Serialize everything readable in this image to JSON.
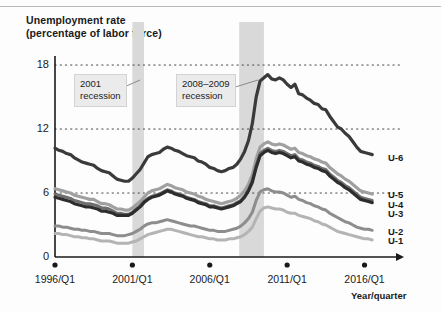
{
  "chart_data": {
    "type": "line",
    "title": "Unemployment rate",
    "subtitle": "(percentage of labor force)",
    "xlabel": "Year/quarter",
    "ylabel": "",
    "ylim": [
      0,
      19.5
    ],
    "xlim": [
      1996.0,
      2017.0
    ],
    "grid": true,
    "gridlines": [
      6,
      12,
      18
    ],
    "legend_position": "right-inline",
    "ytick_labels": [
      "0",
      "6",
      "12",
      "18"
    ],
    "ytick_values": [
      0,
      6,
      12,
      18
    ],
    "xtick_labels": [
      "1996/Q1",
      "2001/Q1",
      "2006/Q1",
      "2011/Q1",
      "2016/Q1"
    ],
    "xtick_values": [
      1996.0,
      2001.0,
      2006.0,
      2011.0,
      2016.0
    ],
    "annotations": [
      {
        "name": "recession-2001",
        "label_line1": "2001",
        "label_line2": "recession",
        "band_start": 2001.0,
        "band_end": 2001.75
      },
      {
        "name": "recession-2008-2009",
        "label_line1": "2008–2009",
        "label_line2": "recession",
        "band_start": 2007.9,
        "band_end": 2009.5
      }
    ],
    "band_color": "#d9d9d9",
    "x": [
      1996.0,
      1996.25,
      1996.5,
      1996.75,
      1997.0,
      1997.25,
      1997.5,
      1997.75,
      1998.0,
      1998.25,
      1998.5,
      1998.75,
      1999.0,
      1999.25,
      1999.5,
      1999.75,
      2000.0,
      2000.25,
      2000.5,
      2000.75,
      2001.0,
      2001.25,
      2001.5,
      2001.75,
      2002.0,
      2002.25,
      2002.5,
      2002.75,
      2003.0,
      2003.25,
      2003.5,
      2003.75,
      2004.0,
      2004.25,
      2004.5,
      2004.75,
      2005.0,
      2005.25,
      2005.5,
      2005.75,
      2006.0,
      2006.25,
      2006.5,
      2006.75,
      2007.0,
      2007.25,
      2007.5,
      2007.75,
      2008.0,
      2008.25,
      2008.5,
      2008.75,
      2009.0,
      2009.25,
      2009.5,
      2009.75,
      2010.0,
      2010.25,
      2010.5,
      2010.75,
      2011.0,
      2011.25,
      2011.5,
      2011.75,
      2012.0,
      2012.25,
      2012.5,
      2012.75,
      2013.0,
      2013.25,
      2013.5,
      2013.75,
      2014.0,
      2014.25,
      2014.5,
      2014.75,
      2015.0,
      2015.25,
      2015.5,
      2015.75,
      2016.0,
      2016.25,
      2016.5
    ],
    "series": [
      {
        "name": "U-6",
        "color": "#3a3a3a",
        "width": 3.2,
        "values": [
          10.2,
          10.0,
          9.9,
          9.7,
          9.6,
          9.3,
          9.1,
          8.9,
          8.8,
          8.7,
          8.6,
          8.3,
          8.1,
          8.0,
          7.9,
          7.6,
          7.3,
          7.2,
          7.1,
          7.1,
          7.4,
          7.8,
          8.2,
          8.8,
          9.4,
          9.6,
          9.7,
          9.8,
          10.1,
          10.3,
          10.2,
          10.0,
          9.9,
          9.7,
          9.5,
          9.4,
          9.3,
          9.0,
          8.9,
          8.7,
          8.4,
          8.3,
          8.1,
          8.0,
          8.1,
          8.3,
          8.4,
          8.7,
          9.2,
          9.9,
          10.9,
          12.5,
          15.0,
          16.5,
          16.8,
          17.1,
          16.7,
          16.6,
          16.8,
          16.6,
          16.2,
          15.9,
          16.2,
          15.3,
          15.2,
          14.9,
          14.7,
          14.4,
          14.3,
          13.9,
          13.8,
          13.2,
          12.7,
          12.2,
          12.0,
          11.6,
          11.3,
          10.8,
          10.3,
          9.9,
          9.8,
          9.7,
          9.6
        ]
      },
      {
        "name": "U-5",
        "color": "#a0a0a0",
        "width": 3.2,
        "values": [
          6.4,
          6.3,
          6.2,
          6.1,
          6.0,
          5.8,
          5.7,
          5.6,
          5.5,
          5.4,
          5.4,
          5.2,
          5.0,
          5.0,
          4.9,
          4.7,
          4.5,
          4.5,
          4.4,
          4.4,
          4.6,
          4.9,
          5.2,
          5.6,
          6.0,
          6.2,
          6.3,
          6.4,
          6.6,
          6.8,
          6.7,
          6.5,
          6.4,
          6.3,
          6.1,
          6.0,
          5.9,
          5.7,
          5.6,
          5.4,
          5.3,
          5.2,
          5.1,
          5.0,
          5.1,
          5.2,
          5.3,
          5.5,
          5.8,
          6.2,
          6.8,
          7.7,
          9.2,
          10.3,
          10.6,
          10.8,
          10.6,
          10.5,
          10.6,
          10.5,
          10.3,
          10.1,
          10.2,
          9.8,
          9.7,
          9.5,
          9.4,
          9.2,
          9.1,
          8.9,
          8.8,
          8.4,
          8.1,
          7.8,
          7.6,
          7.3,
          7.1,
          6.8,
          6.5,
          6.2,
          6.1,
          6.0,
          5.9
        ]
      },
      {
        "name": "U-4",
        "color": "#6e6e6e",
        "width": 3.0,
        "values": [
          5.9,
          5.8,
          5.7,
          5.6,
          5.5,
          5.3,
          5.2,
          5.1,
          5.0,
          5.0,
          4.9,
          4.8,
          4.6,
          4.6,
          4.5,
          4.3,
          4.1,
          4.1,
          4.0,
          4.0,
          4.2,
          4.5,
          4.8,
          5.2,
          5.5,
          5.7,
          5.8,
          5.9,
          6.1,
          6.3,
          6.2,
          6.0,
          5.9,
          5.8,
          5.6,
          5.5,
          5.4,
          5.2,
          5.1,
          5.0,
          4.8,
          4.8,
          4.7,
          4.6,
          4.7,
          4.8,
          4.9,
          5.1,
          5.3,
          5.7,
          6.3,
          7.2,
          8.6,
          9.7,
          10.0,
          10.2,
          10.0,
          9.9,
          10.0,
          9.9,
          9.7,
          9.5,
          9.6,
          9.2,
          9.1,
          8.9,
          8.8,
          8.6,
          8.5,
          8.3,
          8.2,
          7.8,
          7.5,
          7.2,
          7.0,
          6.7,
          6.5,
          6.2,
          5.9,
          5.6,
          5.5,
          5.4,
          5.3
        ]
      },
      {
        "name": "U-3",
        "color": "#2d2d2d",
        "width": 3.2,
        "values": [
          5.6,
          5.5,
          5.4,
          5.3,
          5.2,
          5.0,
          4.9,
          4.8,
          4.7,
          4.7,
          4.6,
          4.5,
          4.3,
          4.3,
          4.2,
          4.1,
          3.9,
          3.9,
          3.9,
          3.9,
          4.1,
          4.4,
          4.7,
          5.1,
          5.4,
          5.6,
          5.7,
          5.8,
          6.0,
          6.2,
          6.1,
          5.9,
          5.8,
          5.7,
          5.5,
          5.4,
          5.3,
          5.1,
          5.0,
          4.9,
          4.7,
          4.7,
          4.6,
          4.5,
          4.6,
          4.7,
          4.8,
          5.0,
          5.2,
          5.6,
          6.2,
          7.0,
          8.4,
          9.5,
          9.8,
          10.0,
          9.8,
          9.7,
          9.8,
          9.7,
          9.5,
          9.3,
          9.4,
          9.0,
          8.9,
          8.7,
          8.6,
          8.4,
          8.3,
          8.1,
          8.0,
          7.6,
          7.3,
          7.0,
          6.8,
          6.5,
          6.3,
          6.0,
          5.7,
          5.4,
          5.3,
          5.2,
          5.1
        ]
      },
      {
        "name": "U-2",
        "color": "#8d8d8d",
        "width": 3.0,
        "values": [
          2.9,
          2.9,
          2.8,
          2.8,
          2.7,
          2.6,
          2.6,
          2.5,
          2.5,
          2.4,
          2.4,
          2.3,
          2.2,
          2.2,
          2.2,
          2.1,
          2.0,
          2.0,
          2.0,
          2.1,
          2.2,
          2.4,
          2.6,
          2.9,
          3.1,
          3.2,
          3.2,
          3.3,
          3.4,
          3.5,
          3.4,
          3.3,
          3.2,
          3.1,
          3.0,
          2.9,
          2.9,
          2.8,
          2.7,
          2.6,
          2.5,
          2.5,
          2.4,
          2.4,
          2.4,
          2.5,
          2.6,
          2.7,
          2.9,
          3.2,
          3.6,
          4.2,
          5.3,
          6.1,
          6.3,
          6.4,
          6.2,
          6.1,
          6.1,
          6.0,
          5.8,
          5.6,
          5.7,
          5.4,
          5.3,
          5.1,
          5.0,
          4.8,
          4.7,
          4.5,
          4.4,
          4.1,
          3.9,
          3.7,
          3.5,
          3.3,
          3.2,
          3.0,
          2.8,
          2.7,
          2.6,
          2.6,
          2.5
        ]
      },
      {
        "name": "U-1",
        "color": "#b4b4b4",
        "width": 3.0,
        "values": [
          2.2,
          2.2,
          2.1,
          2.1,
          2.0,
          1.9,
          1.9,
          1.8,
          1.8,
          1.7,
          1.7,
          1.6,
          1.5,
          1.5,
          1.5,
          1.4,
          1.3,
          1.3,
          1.3,
          1.3,
          1.4,
          1.5,
          1.7,
          1.9,
          2.1,
          2.2,
          2.3,
          2.4,
          2.5,
          2.6,
          2.6,
          2.5,
          2.4,
          2.3,
          2.2,
          2.1,
          2.0,
          1.9,
          1.9,
          1.8,
          1.7,
          1.7,
          1.6,
          1.6,
          1.6,
          1.7,
          1.7,
          1.8,
          1.9,
          2.1,
          2.4,
          2.8,
          3.6,
          4.3,
          4.6,
          4.7,
          4.6,
          4.5,
          4.5,
          4.4,
          4.2,
          4.1,
          4.1,
          3.9,
          3.8,
          3.7,
          3.6,
          3.4,
          3.3,
          3.1,
          3.0,
          2.8,
          2.6,
          2.4,
          2.3,
          2.2,
          2.1,
          2.0,
          1.9,
          1.8,
          1.7,
          1.7,
          1.6
        ]
      }
    ],
    "series_labels": [
      {
        "name": "U-6",
        "y_px": 158
      },
      {
        "name": "U-5",
        "y_px": 195
      },
      {
        "name": "U-4",
        "y_px": 205
      },
      {
        "name": "U-3",
        "y_px": 214
      },
      {
        "name": "U-2",
        "y_px": 232
      },
      {
        "name": "U-1",
        "y_px": 241
      }
    ]
  }
}
